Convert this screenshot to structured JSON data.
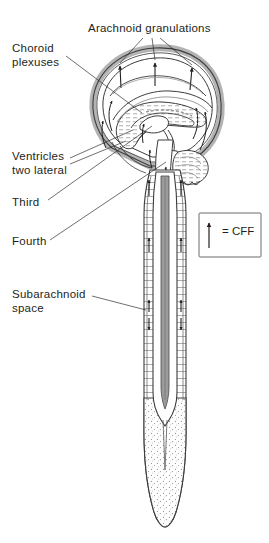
{
  "figure": {
    "background_color": "#ffffff",
    "ink_color": "#231f20",
    "shade_color": "#c9c9c9",
    "light_shade_color": "#e2e2e2"
  },
  "labels": {
    "arachnoid_granulations": "Arachnoid granulations",
    "choroid_plexuses": "Choroid\nplexuses",
    "ventricles_two_lateral": "Ventricles\ntwo lateral",
    "third": "Third",
    "fourth": "Fourth",
    "subarachnoid_space": "Subarachnoid\nspace"
  },
  "legend": {
    "equals_label": "= CFF",
    "arrow_icon": "up-arrow-icon"
  }
}
